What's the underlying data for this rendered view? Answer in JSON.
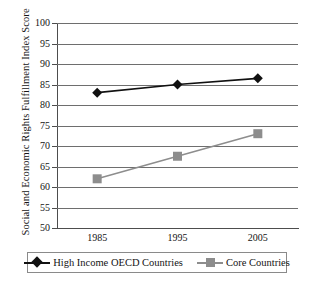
{
  "chart_data": {
    "type": "line",
    "title": "",
    "xlabel": "",
    "ylabel": "Social and Economic Rights Fulfillment Index Score",
    "categories": [
      "1985",
      "1995",
      "2005"
    ],
    "x": [
      1985,
      1995,
      2005
    ],
    "ylim": [
      50,
      100
    ],
    "ytick_labels": [
      "100",
      "95",
      "90",
      "85",
      "80",
      "75",
      "70",
      "65",
      "60",
      "55",
      "50"
    ],
    "yticks": [
      100,
      95,
      90,
      85,
      80,
      75,
      70,
      65,
      60,
      55,
      50
    ],
    "grid": true,
    "legend_position": "bottom",
    "series": [
      {
        "name": "High Income OECD Countries",
        "values": [
          83,
          85,
          86.5
        ],
        "color": "#111111",
        "marker": "diamond"
      },
      {
        "name": "Core Countries",
        "values": [
          62,
          67.5,
          73
        ],
        "color": "#8d8d8d",
        "marker": "square"
      }
    ]
  },
  "legend": {
    "entries": [
      {
        "label": "High Income OECD Countries",
        "marker_name": "legend-marker-diamond"
      },
      {
        "label": "Core Countries",
        "marker_name": "legend-marker-square"
      }
    ]
  },
  "page": {
    "bottom_edge_text": ""
  }
}
